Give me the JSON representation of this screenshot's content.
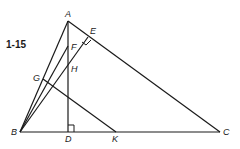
{
  "figure_label": "1-15",
  "points": {
    "A": "A",
    "B": "B",
    "C": "C",
    "D": "D",
    "E": "E",
    "F": "F",
    "G": "G",
    "H": "H",
    "K": "K"
  },
  "segments": [
    "AB",
    "AC",
    "BC",
    "AD",
    "BF",
    "BE",
    "GK"
  ],
  "right_angles": [
    "E",
    "D"
  ]
}
